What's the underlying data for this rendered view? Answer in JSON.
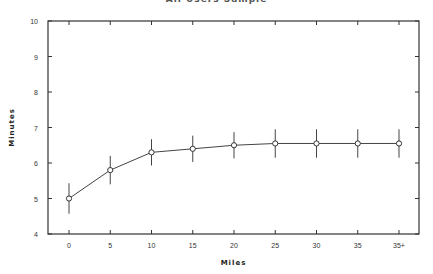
{
  "chart_data": {
    "type": "line",
    "title": "All Users Sample",
    "xlabel": "Miles",
    "ylabel": "Minutes",
    "categories": [
      "0",
      "5",
      "10",
      "15",
      "20",
      "25",
      "30",
      "35",
      "35+"
    ],
    "series": [
      {
        "name": "Minutes",
        "values": [
          5.0,
          5.8,
          6.3,
          6.4,
          6.5,
          6.55,
          6.55,
          6.55,
          6.55
        ],
        "error": [
          0.43,
          0.4,
          0.37,
          0.37,
          0.37,
          0.4,
          0.4,
          0.4,
          0.4
        ]
      }
    ],
    "ylim": [
      4,
      10
    ],
    "yticks": [
      4,
      5,
      6,
      7,
      8,
      9,
      10
    ],
    "grid": false,
    "legend": "none",
    "marker": "open-circle",
    "error_bars": true
  }
}
